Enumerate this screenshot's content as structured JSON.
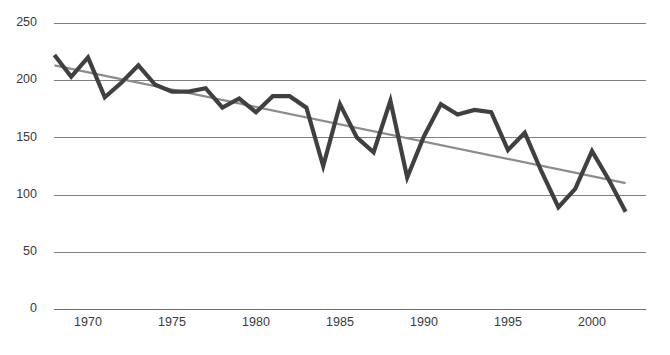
{
  "chart_data": {
    "type": "line",
    "title": "",
    "subtitle": "",
    "xlabel": "",
    "ylabel": "",
    "xlim": [
      1967.5,
      2002.5
    ],
    "ylim": [
      0,
      250
    ],
    "grid": true,
    "legend": "none",
    "y_ticks": [
      250,
      200,
      150,
      100,
      50,
      0
    ],
    "x_ticks": [
      1970,
      1975,
      1980,
      1985,
      1990,
      1995,
      2000
    ],
    "x": [
      1968,
      1969,
      1970,
      1971,
      1972,
      1973,
      1974,
      1975,
      1976,
      1977,
      1978,
      1979,
      1980,
      1981,
      1982,
      1983,
      1984,
      1985,
      1986,
      1987,
      1988,
      1989,
      1990,
      1991,
      1992,
      1993,
      1994,
      1995,
      1996,
      1997,
      1998,
      1999,
      2000,
      2001,
      2002
    ],
    "series": [
      {
        "name": "Observed",
        "color": "#404040",
        "values": [
          222,
          203,
          220,
          185,
          198,
          213,
          196,
          190,
          190,
          193,
          176,
          184,
          172,
          186,
          186,
          176,
          125,
          179,
          150,
          137,
          182,
          115,
          151,
          179,
          170,
          174,
          172,
          139,
          154,
          120,
          89,
          105,
          138,
          113,
          85
        ]
      }
    ],
    "trendline": {
      "name": "Linear trend",
      "color": "#8c8c8c",
      "x_start": 1968,
      "x_end": 2002,
      "y_start": 213,
      "y_end": 110
    }
  },
  "geometry": {
    "plot_left": 46,
    "plot_right": 634,
    "y_top_px": 23,
    "y_bottom_px": 309,
    "x_tick_y": 317
  }
}
